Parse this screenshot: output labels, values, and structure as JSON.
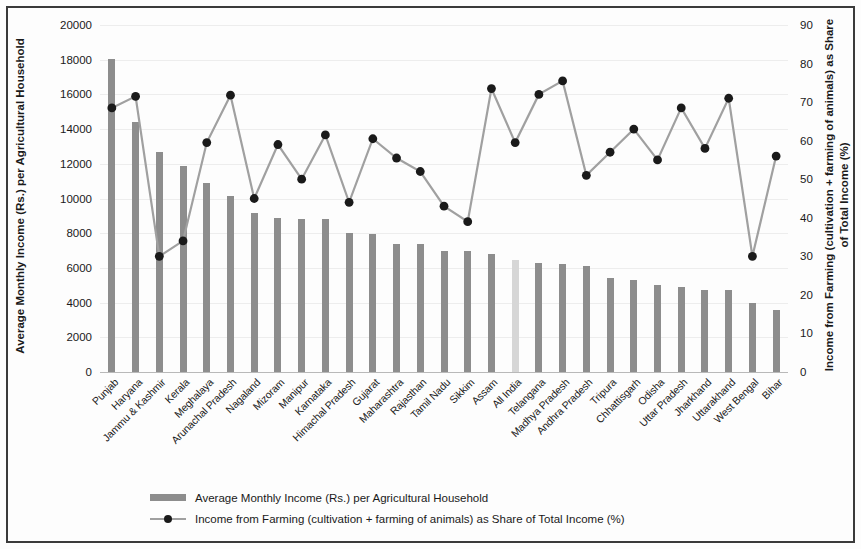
{
  "chart_data": {
    "type": "bar",
    "title": "",
    "subtitle": "",
    "xlabel": "",
    "ylabel": "Average Monthly Income (Rs.) per Agricultural Household",
    "y2label": "Income from Farming  (cultivation + farming of animals) as Share of Total Income (%)",
    "grid": true,
    "legend_position": "bottom",
    "ylim": [
      0,
      20000
    ],
    "y2lim": [
      0,
      90
    ],
    "yticks": [
      "0",
      "2000",
      "4000",
      "6000",
      "8000",
      "10000",
      "12000",
      "14000",
      "16000",
      "18000",
      "20000"
    ],
    "y2ticks": [
      "0",
      "10",
      "20",
      "30",
      "40",
      "50",
      "60",
      "70",
      "80",
      "90"
    ],
    "highlight_category": "All India",
    "categories": [
      "Punjab",
      "Haryana",
      "Jammu & Kashmir",
      "Kerala",
      "Meghalaya",
      "Arunachal Pradesh",
      "Nagaland",
      "Mizoram",
      "Manipur",
      "Karnataka",
      "Himachal Pradesh",
      "Gujarat",
      "Maharashtra",
      "Rajasthan",
      "Tamil Nadu",
      "Sikkim",
      "Assam",
      "All India",
      "Telangana",
      "Madhya Pradesh",
      "Andhra Pradesh",
      "Tripura",
      "Chhattisgarh",
      "Odisha",
      "Uttar Pradesh",
      "Jharkhand",
      "Uttarakhand",
      "West Bengal",
      "Bihar"
    ],
    "series": [
      {
        "name": "Average Monthly Income (Rs.) per Agricultural Household",
        "axis": "left",
        "kind": "bar",
        "color": "#8d8d8d",
        "values": [
          18060,
          14430,
          12680,
          11890,
          10890,
          10140,
          9190,
          8850,
          8840,
          8830,
          8030,
          7930,
          7390,
          7350,
          6980,
          6950,
          6810,
          6430,
          6310,
          6210,
          6090,
          5430,
          5300,
          5010,
          4920,
          4720,
          4700,
          3980,
          3560
        ]
      },
      {
        "name": "Income from Farming  (cultivation + farming of animals) as Share of Total Income (%)",
        "axis": "right",
        "kind": "line",
        "color": "#a0a0a0",
        "marker_color": "#1a1a1a",
        "values": [
          68.5,
          71.5,
          30.0,
          34.0,
          59.5,
          71.8,
          45.0,
          59.0,
          50.0,
          61.5,
          44.0,
          60.5,
          55.5,
          52.0,
          43.0,
          39.0,
          73.5,
          59.5,
          72.0,
          75.5,
          51.0,
          57.0,
          63.0,
          55.0,
          68.5,
          58.0,
          71.0,
          30.0,
          56.0
        ]
      }
    ],
    "legend": [
      {
        "label": "Average Monthly Income (Rs.) per Agricultural Household",
        "marker": "bar-swatch"
      },
      {
        "label": "Income from Farming  (cultivation + farming of animals) as Share of Total Income (%)",
        "marker": "line-point-swatch"
      }
    ]
  }
}
